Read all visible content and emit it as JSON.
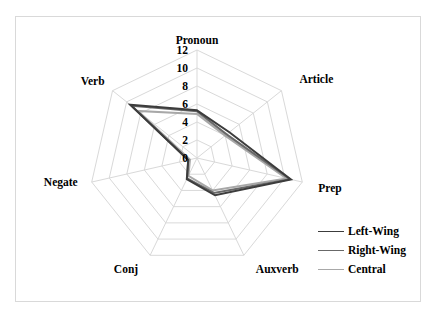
{
  "chart_data": {
    "type": "radar",
    "title": "",
    "categories": [
      "Pronoun",
      "Article",
      "Prep",
      "Auxverb",
      "Conj",
      "Negate",
      "Verb"
    ],
    "series": [
      {
        "name": "Left-Wing",
        "color": "#3c3c3c",
        "values": [
          5.3,
          4.6,
          10.7,
          4.6,
          2.6,
          1.0,
          9.5
        ]
      },
      {
        "name": "Right-Wing",
        "color": "#686868",
        "values": [
          5.2,
          4.2,
          10.6,
          4.3,
          2.5,
          1.0,
          9.3
        ]
      },
      {
        "name": "Central",
        "color": "#a8a8a8",
        "values": [
          4.9,
          4.0,
          10.2,
          4.0,
          2.2,
          0.8,
          8.4
        ]
      }
    ],
    "radial_ticks": [
      0,
      2,
      4,
      6,
      8,
      10,
      12
    ],
    "rlim": [
      0,
      12
    ],
    "grid": true,
    "gridline_color": "#d9d9d9",
    "legend_position": "right-bottom"
  },
  "legend": {
    "items": [
      {
        "label": "Left-Wing",
        "color": "#3c3c3c"
      },
      {
        "label": "Right-Wing",
        "color": "#686868"
      },
      {
        "label": "Central",
        "color": "#a8a8a8"
      }
    ]
  }
}
